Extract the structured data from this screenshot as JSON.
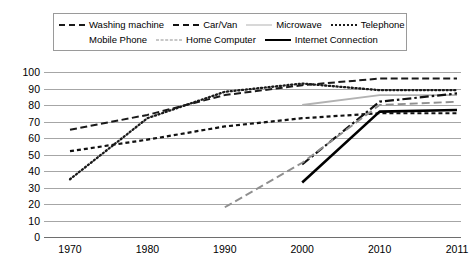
{
  "chart_data": {
    "type": "line",
    "title": "",
    "subtitle": "",
    "xlabel": "",
    "ylabel": "",
    "categories": [
      "1970",
      "1980",
      "1990",
      "2000",
      "2010",
      "2011"
    ],
    "ylim": [
      0,
      100
    ],
    "yticks": [
      0,
      10,
      20,
      30,
      40,
      50,
      60,
      70,
      80,
      90,
      100
    ],
    "grid": true,
    "legend_position": "top",
    "series": [
      {
        "name": "Washing machine",
        "style": "dashed",
        "color": "#1a1a1a",
        "x": [
          "1970",
          "1980",
          "1990",
          "2000",
          "2010",
          "2011"
        ],
        "values": [
          65,
          74,
          86,
          92,
          96,
          96
        ]
      },
      {
        "name": "Car/Van",
        "style": "dashed-short",
        "color": "#111111",
        "x": [
          "1970",
          "1980",
          "1990",
          "2000",
          "2010",
          "2011"
        ],
        "values": [
          52,
          59,
          67,
          72,
          75,
          75
        ]
      },
      {
        "name": "Microwave",
        "style": "solid",
        "color": "#b2b2b2",
        "x": [
          "2000",
          "2010",
          "2011"
        ],
        "values": [
          80,
          86,
          86
        ]
      },
      {
        "name": "Telephone",
        "style": "dotted",
        "color": "#1a1a1a",
        "x": [
          "1970",
          "1980",
          "1990",
          "2000",
          "2010",
          "2011"
        ],
        "values": [
          35,
          72,
          88,
          93,
          89,
          89
        ]
      },
      {
        "name": "Mobile Phone",
        "style": "dash-dot",
        "color": "#111111",
        "x": [
          "2000",
          "2010",
          "2011"
        ],
        "values": [
          44,
          82,
          87
        ]
      },
      {
        "name": "Home Computer",
        "style": "dashed-gray",
        "color": "#8f8f8f",
        "x": [
          "1990",
          "2000",
          "2010",
          "2011"
        ],
        "values": [
          18,
          45,
          80,
          82
        ]
      },
      {
        "name": "Internet Connection",
        "style": "solid-bold",
        "color": "#000000",
        "x": [
          "2000",
          "2010",
          "2011"
        ],
        "values": [
          33,
          76,
          77
        ]
      }
    ]
  },
  "legend": {
    "rows": [
      [
        {
          "label": "Washing machine",
          "swatch": "dash-sm"
        },
        {
          "label": "Car/Van",
          "swatch": "dash-sm2"
        },
        {
          "label": "Microwave",
          "swatch": "solid-gray"
        },
        {
          "label": "Telephone",
          "swatch": "dot"
        }
      ],
      [
        {
          "label": "Mobile Phone",
          "swatch": "dashdot"
        },
        {
          "label": "Home Computer",
          "swatch": "dash-gray"
        },
        {
          "label": "Internet Connection",
          "swatch": "solid-blk"
        }
      ]
    ]
  },
  "axes": {
    "y_tick_labels": [
      "100",
      "90",
      "80",
      "70",
      "60",
      "50",
      "40",
      "30",
      "20",
      "10",
      "0"
    ],
    "x_tick_labels": [
      "1970",
      "1980",
      "1990",
      "2000",
      "2010",
      "2011"
    ]
  },
  "footer": {
    "corner_mark": ""
  }
}
